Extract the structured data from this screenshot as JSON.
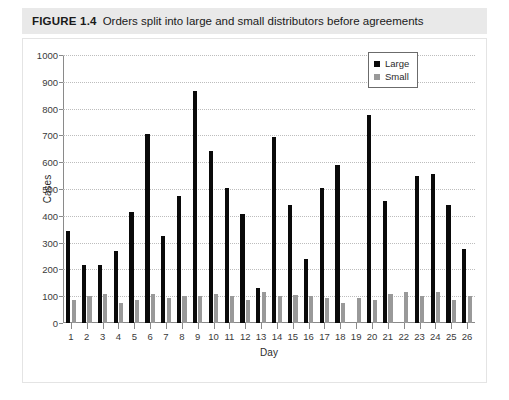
{
  "figure": {
    "label": "FIGURE 1.4",
    "caption": "Orders split into large and small distributors before agreements"
  },
  "legend": {
    "position": "top-right",
    "entries": [
      {
        "label": "Large",
        "color": "#0a0a0a",
        "swatch_icon": "square-filled-icon"
      },
      {
        "label": "Small",
        "color": "#999999",
        "swatch_icon": "square-filled-icon"
      }
    ]
  },
  "chart_data": {
    "type": "bar",
    "title": "Orders split into large and small distributors before agreements",
    "xlabel": "Day",
    "ylabel": "Cases",
    "ylim": [
      0,
      1000
    ],
    "ytick_step": 100,
    "yticks": [
      0,
      100,
      200,
      300,
      400,
      500,
      600,
      700,
      800,
      900,
      1000
    ],
    "grid": true,
    "grid_axis": "y",
    "grid_style": "dotted",
    "legend_position": "top-right",
    "categories": [
      1,
      2,
      3,
      4,
      5,
      6,
      7,
      8,
      9,
      10,
      11,
      12,
      13,
      14,
      15,
      16,
      17,
      18,
      19,
      20,
      21,
      22,
      23,
      24,
      25,
      26
    ],
    "series": [
      {
        "name": "Large",
        "color": "#0a0a0a",
        "values": [
          345,
          215,
          215,
          270,
          415,
          705,
          325,
          475,
          865,
          640,
          505,
          405,
          130,
          695,
          440,
          240,
          505,
          590,
          0,
          775,
          455,
          0,
          550,
          555,
          440,
          275
        ]
      },
      {
        "name": "Small",
        "color": "#999999",
        "values": [
          85,
          100,
          110,
          75,
          85,
          110,
          95,
          100,
          100,
          110,
          100,
          85,
          115,
          100,
          105,
          100,
          95,
          75,
          95,
          85,
          110,
          115,
          100,
          115,
          85,
          100
        ]
      }
    ]
  }
}
